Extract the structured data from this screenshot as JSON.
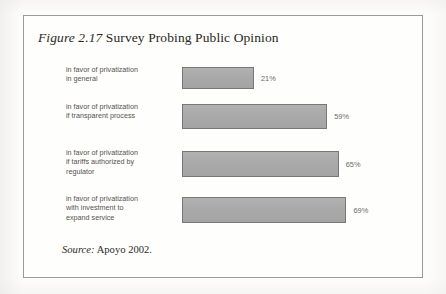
{
  "figure": {
    "number": "Figure 2.17",
    "caption": "Survey Probing Public Opinion",
    "source_lead": "Source:",
    "source_text": "Apoyo 2002.",
    "frame_color": "#9a9a98",
    "page_background": "#fdfdfc"
  },
  "chart_data": {
    "type": "bar",
    "orientation": "horizontal",
    "title": "Figure 2.17 Survey Probing Public Opinion",
    "xlabel": "",
    "ylabel": "",
    "xlim": [
      0,
      100
    ],
    "grid": false,
    "legend": "none",
    "bar_color": "#a9a9a9",
    "bar_border_color": "#77777a",
    "categories": [
      "in favor of privatization in general",
      "in favor of privatization if transparent process",
      "in favor of privatization if tariffs authorized by regulator",
      "in favor of privatization with investment to expand service"
    ],
    "values": [
      21,
      59,
      65,
      69
    ],
    "value_labels": [
      "21%",
      "59%",
      "65%",
      "69%"
    ]
  },
  "rows": [
    {
      "label_lines": [
        "in favor of privatization",
        "in general"
      ],
      "value": 21,
      "value_label": "21%"
    },
    {
      "label_lines": [
        "in favor of privatization",
        "if transparent process"
      ],
      "value": 59,
      "value_label": "59%"
    },
    {
      "label_lines": [
        "in favor of privatization",
        "if tariffs authorized by",
        "regulator"
      ],
      "value": 65,
      "value_label": "65%"
    },
    {
      "label_lines": [
        "in favor of privatization",
        "with investment to",
        "expand service"
      ],
      "value": 69,
      "value_label": "69%"
    }
  ]
}
